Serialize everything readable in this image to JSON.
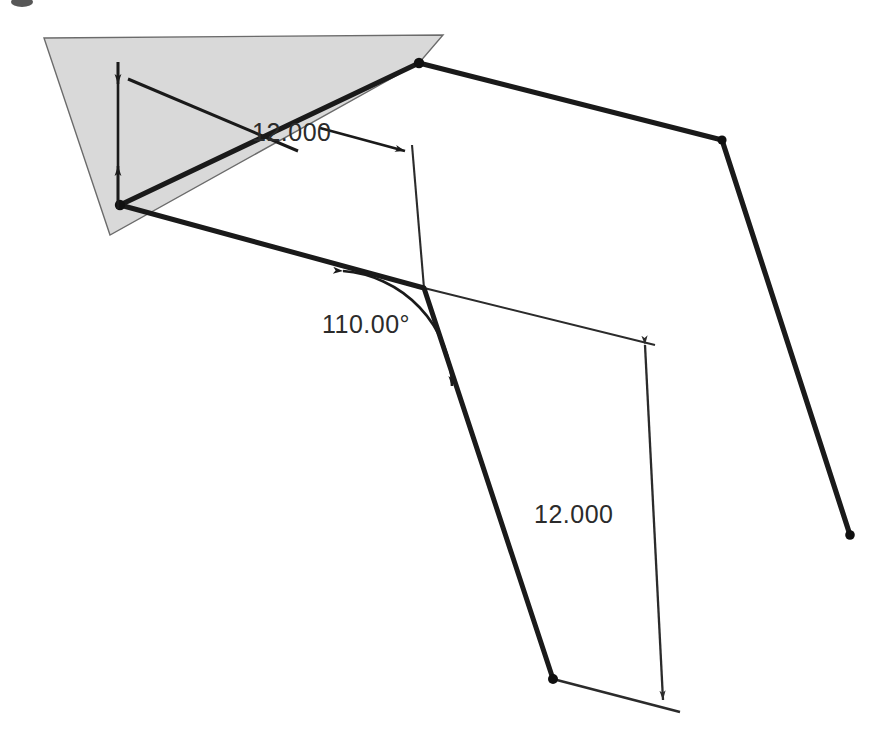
{
  "drawing": {
    "kind": "isometric-cad-sketch",
    "background_color": "#ffffff",
    "plane_fill_color": "#d9d9d9",
    "plane_edge_color": "#6b6b6b",
    "solid_line_color": "#1a1a1a",
    "thin_line_color": "#2b2b2b",
    "centerline_color": "#4d4d4d",
    "text_color": "#2b2b2b",
    "dimensions": [
      {
        "id": "length-dim-upper",
        "label": "12.000",
        "value": 12.0,
        "unit": "in",
        "type": "linear",
        "text_x": 252,
        "text_y": 141
      },
      {
        "id": "angle-dim",
        "label": "110.00°",
        "value": 110.0,
        "unit": "deg",
        "type": "angular",
        "text_x": 322,
        "text_y": 333
      },
      {
        "id": "length-dim-lower",
        "label": "12.000",
        "value": 12.0,
        "unit": "in",
        "type": "linear",
        "text_x": 536,
        "text_y": 523
      }
    ],
    "geometry": {
      "sketch_plane_polygon": "44,38 443,35 419,63 110,235",
      "centerline": "120,205 419,63",
      "thick_polyline": "120,205 419,63 722,140 850,535",
      "thin_profile": "412,145 424,288 655,345 663,700 553,679 424,288",
      "lower_thin_run": "120,205 424,288 655,345",
      "vertices": [
        {
          "x": 120,
          "y": 205
        },
        {
          "x": 419,
          "y": 63
        },
        {
          "x": 722,
          "y": 140
        },
        {
          "x": 850,
          "y": 535
        },
        {
          "x": 553,
          "y": 679
        }
      ]
    },
    "annotations": {
      "upper_dim_extension_top": "118,66 118,205",
      "upper_dim_arrow_top_y": 77,
      "upper_dim_arrow_bottom_y": 172,
      "upper_leader_left": "130,80 296,152",
      "upper_leader_right": "318,128 409,152",
      "lower_dim_line": "645,345 663,700",
      "angle_arc_from": "342,272",
      "angle_arc_to": "452,388"
    }
  }
}
